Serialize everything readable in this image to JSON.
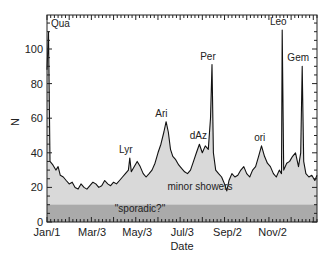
{
  "chart_data": {
    "type": "area",
    "title": "",
    "xlabel": "Date",
    "ylabel": "N",
    "ylim": [
      0,
      118
    ],
    "xlim_days": [
      0,
      365
    ],
    "grid": false,
    "legend": "none",
    "x_tick_labels": [
      {
        "label": "Jan/1",
        "day": 0
      },
      {
        "label": "Mar/3",
        "day": 61
      },
      {
        "label": "May/3",
        "day": 122
      },
      {
        "label": "Jul/3",
        "day": 183
      },
      {
        "label": "Sep/2",
        "day": 244
      },
      {
        "label": "Nov/2",
        "day": 305
      }
    ],
    "y_ticks": [
      0,
      20,
      40,
      60,
      80,
      100
    ],
    "bands": [
      {
        "name": "\"sporadic?\"",
        "from": 0,
        "to": 10,
        "color": "#aaaaaa"
      },
      {
        "name": "minor showers",
        "color": "#d9d9d9"
      }
    ],
    "annotations": [
      {
        "text": "Qua",
        "day": 3,
        "value": 110
      },
      {
        "text": "Lyr",
        "day": 112,
        "value": 37
      },
      {
        "text": "Ari",
        "day": 160,
        "value": 58
      },
      {
        "text": "dAz",
        "day": 210,
        "value": 45
      },
      {
        "text": "Per",
        "day": 223,
        "value": 91
      },
      {
        "text": "ori",
        "day": 293,
        "value": 44
      },
      {
        "text": "Leo",
        "day": 318,
        "value": 111
      },
      {
        "text": "Gem",
        "day": 345,
        "value": 90
      }
    ],
    "series": [
      {
        "name": "N",
        "points": [
          [
            0,
            88
          ],
          [
            2,
            110
          ],
          [
            4,
            35
          ],
          [
            8,
            33
          ],
          [
            12,
            30
          ],
          [
            15,
            32
          ],
          [
            18,
            27
          ],
          [
            22,
            26
          ],
          [
            26,
            24
          ],
          [
            30,
            22
          ],
          [
            34,
            23
          ],
          [
            38,
            20
          ],
          [
            42,
            19
          ],
          [
            46,
            22
          ],
          [
            50,
            20
          ],
          [
            54,
            19
          ],
          [
            58,
            21
          ],
          [
            62,
            23
          ],
          [
            66,
            22
          ],
          [
            70,
            20
          ],
          [
            74,
            21
          ],
          [
            78,
            24
          ],
          [
            82,
            22
          ],
          [
            86,
            21
          ],
          [
            90,
            23
          ],
          [
            94,
            22
          ],
          [
            98,
            24
          ],
          [
            102,
            26
          ],
          [
            106,
            28
          ],
          [
            110,
            30
          ],
          [
            112,
            37
          ],
          [
            114,
            29
          ],
          [
            118,
            32
          ],
          [
            122,
            35
          ],
          [
            126,
            32
          ],
          [
            130,
            28
          ],
          [
            134,
            26
          ],
          [
            138,
            28
          ],
          [
            142,
            30
          ],
          [
            146,
            34
          ],
          [
            150,
            40
          ],
          [
            154,
            45
          ],
          [
            158,
            52
          ],
          [
            161,
            58
          ],
          [
            164,
            52
          ],
          [
            167,
            42
          ],
          [
            170,
            38
          ],
          [
            174,
            36
          ],
          [
            178,
            33
          ],
          [
            182,
            31
          ],
          [
            186,
            29
          ],
          [
            190,
            28
          ],
          [
            194,
            30
          ],
          [
            198,
            35
          ],
          [
            202,
            40
          ],
          [
            206,
            45
          ],
          [
            210,
            40
          ],
          [
            214,
            44
          ],
          [
            218,
            42
          ],
          [
            221,
            60
          ],
          [
            223,
            91
          ],
          [
            225,
            40
          ],
          [
            228,
            30
          ],
          [
            232,
            28
          ],
          [
            236,
            26
          ],
          [
            240,
            22
          ],
          [
            243,
            18
          ],
          [
            246,
            24
          ],
          [
            250,
            28
          ],
          [
            254,
            26
          ],
          [
            258,
            27
          ],
          [
            262,
            30
          ],
          [
            266,
            32
          ],
          [
            270,
            28
          ],
          [
            274,
            26
          ],
          [
            278,
            30
          ],
          [
            282,
            32
          ],
          [
            286,
            38
          ],
          [
            290,
            44
          ],
          [
            294,
            38
          ],
          [
            298,
            34
          ],
          [
            302,
            32
          ],
          [
            306,
            28
          ],
          [
            310,
            26
          ],
          [
            314,
            30
          ],
          [
            317,
            28
          ],
          [
            318,
            111
          ],
          [
            320,
            30
          ],
          [
            324,
            34
          ],
          [
            328,
            35
          ],
          [
            332,
            38
          ],
          [
            336,
            40
          ],
          [
            340,
            32
          ],
          [
            343,
            40
          ],
          [
            345,
            90
          ],
          [
            347,
            35
          ],
          [
            350,
            28
          ],
          [
            354,
            26
          ],
          [
            358,
            27
          ],
          [
            362,
            24
          ],
          [
            365,
            27
          ]
        ]
      }
    ]
  },
  "labels": {
    "y_axis": "N",
    "x_axis": "Date",
    "minor": "minor showers",
    "sporadic": "\"sporadic?\""
  }
}
